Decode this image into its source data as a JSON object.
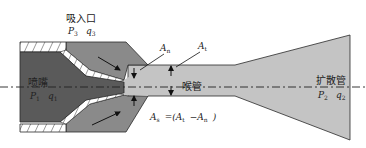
{
  "labels": {
    "suction_inlet": "吸入口",
    "suction_p": "P",
    "suction_p_sub": "3",
    "suction_q": "q",
    "suction_q_sub": "3",
    "nozzle": "喷嘴",
    "nozzle_p": "P",
    "nozzle_p_sub": "1",
    "nozzle_q": "q",
    "nozzle_q_sub": "1",
    "throat": "喉管",
    "diffuser": "扩散管",
    "diffuser_p": "P",
    "diffuser_p_sub": "2",
    "diffuser_q": "q",
    "diffuser_q_sub": "2",
    "area_nozzle": "A",
    "area_nozzle_sub": "n",
    "area_throat": "A",
    "area_throat_sub": "t",
    "area_suction_formula_lhs": "A",
    "area_suction_formula_lhs_sub": "s",
    "area_suction_formula_rhs": "=(A",
    "area_suction_formula_t_sub": "t",
    "area_suction_formula_minus": "−A",
    "area_suction_formula_n_sub": "n",
    "area_suction_formula_close": ")"
  },
  "colors": {
    "nozzle_body": "#5a5a5a",
    "suction_body": "#8a8a8a",
    "flow_channel": "#c4c4c4",
    "outline": "#2a2a2a"
  }
}
